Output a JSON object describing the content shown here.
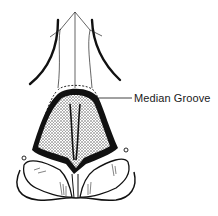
{
  "diagram": {
    "labels": [
      {
        "id": "median-groove",
        "text": "Median Groove",
        "pointer_to": "dome of nasal tip"
      }
    ],
    "colors": {
      "ink": "#111111",
      "stipple": "#8a8a8a",
      "background": "#ffffff"
    }
  }
}
